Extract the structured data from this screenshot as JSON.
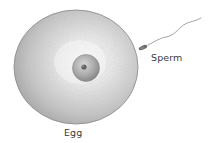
{
  "figure": {
    "type": "biology-illustration"
  },
  "labels": {
    "sperm": "Sperm",
    "egg": "Egg"
  },
  "colors": {
    "background": "#ffffff",
    "egg_fill_center": "#f4f4f4",
    "egg_fill_edge": "#a8a8a8",
    "egg_outline": "#8a8a8a",
    "nucleus_fill": "#b5b5b5",
    "nucleus_dark": "#7a7a7a",
    "nucleolus": "#5a5a5a",
    "sperm_head": "#6e6e6e",
    "sperm_tail": "#8a8a8a",
    "label_text": "#3a3a3a"
  },
  "icons": {
    "egg": "egg-cell-icon",
    "nucleus": "nucleus-icon",
    "sperm": "sperm-cell-icon"
  }
}
